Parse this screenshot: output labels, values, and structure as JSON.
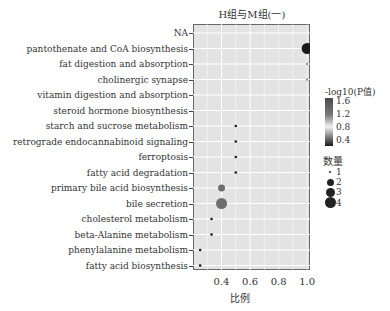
{
  "chart_data": {
    "type": "scatter",
    "title": "H组与M组(一)",
    "xlabel": "比例",
    "ylabel": "",
    "xlim": [
      0.2,
      1.02
    ],
    "xticks": [
      0.4,
      0.6,
      0.8,
      1.0
    ],
    "xtick_labels": [
      "0.4",
      "0.6",
      "0.8",
      "1.0"
    ],
    "grid": true,
    "categories": [
      "NA",
      "pantothenate and CoA biosynthesis",
      "fat digestion and absorption",
      "cholinergic synapse",
      "vitamin digestion and absorption",
      "steroid hormone biosynthesis",
      "starch and sucrose metabolism",
      "retrograde endocannabinoid signaling",
      "ferroptosis",
      "fatty acid degradation",
      "primary bile acid biosynthesis",
      "bile secretion",
      "cholesterol metabolism",
      "beta-Alanine metabolism",
      "phenylalanine metabolism",
      "fatty acid biosynthesis"
    ],
    "points": [
      {
        "pathway": "pantothenate and CoA biosynthesis",
        "ratio": 1.0,
        "count": 4,
        "neg_log10_p": 0.4
      },
      {
        "pathway": "fat digestion and absorption",
        "ratio": 1.0,
        "count": 1,
        "neg_log10_p": 0.8
      },
      {
        "pathway": "cholinergic synapse",
        "ratio": 1.0,
        "count": 1,
        "neg_log10_p": 0.8
      },
      {
        "pathway": "starch and sucrose metabolism",
        "ratio": 0.5,
        "count": 1,
        "neg_log10_p": 0.5
      },
      {
        "pathway": "retrograde endocannabinoid signaling",
        "ratio": 0.5,
        "count": 1,
        "neg_log10_p": 0.5
      },
      {
        "pathway": "ferroptosis",
        "ratio": 0.5,
        "count": 1,
        "neg_log10_p": 0.5
      },
      {
        "pathway": "fatty acid degradation",
        "ratio": 0.5,
        "count": 1,
        "neg_log10_p": 0.5
      },
      {
        "pathway": "primary bile acid biosynthesis",
        "ratio": 0.4,
        "count": 2,
        "neg_log10_p": 1.4
      },
      {
        "pathway": "bile secretion",
        "ratio": 0.4,
        "count": 4,
        "neg_log10_p": 1.4
      },
      {
        "pathway": "cholesterol metabolism",
        "ratio": 0.33,
        "count": 1,
        "neg_log10_p": 0.5
      },
      {
        "pathway": "beta-Alanine metabolism",
        "ratio": 0.33,
        "count": 1,
        "neg_log10_p": 0.5
      },
      {
        "pathway": "phenylalanine metabolism",
        "ratio": 0.25,
        "count": 1,
        "neg_log10_p": 0.5
      },
      {
        "pathway": "fatty acid biosynthesis",
        "ratio": 0.25,
        "count": 1,
        "neg_log10_p": 0.5
      }
    ],
    "color_legend": {
      "title": "-log10(P值)",
      "ticks": [
        "1.6",
        "1.2",
        "0.8",
        "0.4"
      ]
    },
    "size_legend": {
      "title": "数量",
      "values": [
        "1",
        "2",
        "3",
        "4"
      ]
    }
  }
}
